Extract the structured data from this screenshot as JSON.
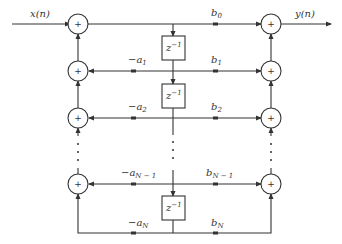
{
  "diagram": {
    "input_label": "x(n)",
    "output_label": "y(n)",
    "delay_label": "z",
    "delay_exp": "−1",
    "plus": "+",
    "feedback": [
      {
        "base": "−a",
        "sub": "1"
      },
      {
        "base": "−a",
        "sub": "2"
      },
      {
        "base": "−a",
        "sub": "N − 1"
      },
      {
        "base": "−a",
        "sub": "N"
      }
    ],
    "feedforward": [
      {
        "base": "b",
        "sub": "0"
      },
      {
        "base": "b",
        "sub": "1"
      },
      {
        "base": "b",
        "sub": "2"
      },
      {
        "base": "b",
        "sub": "N − 1"
      },
      {
        "base": "b",
        "sub": "N"
      }
    ],
    "colors": {
      "stroke": "#333333",
      "background": "#ffffff"
    }
  }
}
